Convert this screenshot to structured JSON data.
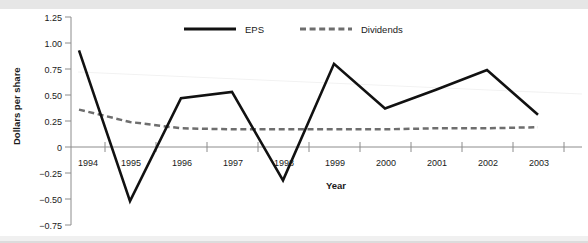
{
  "chart_data": {
    "type": "line",
    "title": "",
    "xlabel": "Year",
    "ylabel": "Dollars per share",
    "categories": [
      "1994",
      "1995",
      "1996",
      "1997",
      "1998",
      "1999",
      "2000",
      "2001",
      "2002",
      "2003"
    ],
    "x": [
      1994,
      1995,
      1996,
      1997,
      1998,
      1999,
      2000,
      2001,
      2002,
      2003
    ],
    "series": [
      {
        "name": "EPS",
        "style": "solid",
        "color": "#111111",
        "values": [
          0.93,
          -0.52,
          0.47,
          0.53,
          -0.32,
          0.8,
          0.37,
          0.55,
          0.74,
          0.31
        ]
      },
      {
        "name": "Dividends",
        "style": "dashed",
        "color": "#6e6e6e",
        "values": [
          0.36,
          0.24,
          0.18,
          0.17,
          0.17,
          0.17,
          0.17,
          0.18,
          0.18,
          0.19
        ]
      }
    ],
    "ylim": [
      -0.75,
      1.25
    ],
    "ytick_labels": [
      "1.25",
      "1.00",
      "0.75",
      "0.50",
      "0.25",
      "0",
      "−0.25",
      "−0.50",
      "−0.75"
    ],
    "ytick_values": [
      1.25,
      1.0,
      0.75,
      0.5,
      0.25,
      0,
      -0.25,
      -0.5,
      -0.75
    ],
    "grid": false,
    "legend_position": "top-center",
    "legend_entries": [
      "EPS",
      "Dividends"
    ],
    "axis_color": "#8c8c8c",
    "background": "#ffffff"
  },
  "legend": {
    "eps_label": "EPS",
    "dividends_label": "Dividends"
  },
  "axes": {
    "y_title": "Dollars per share",
    "x_title": "Year"
  }
}
